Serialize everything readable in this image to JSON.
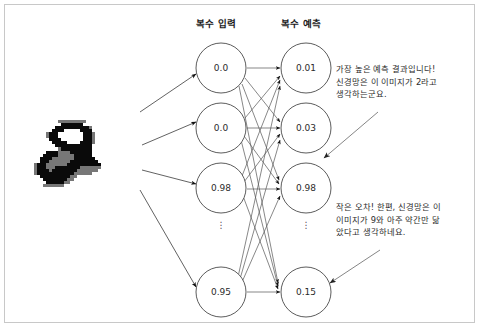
{
  "diagram": {
    "title_inputs": "복수 입력",
    "title_outputs": "복수 예측",
    "ellipsis": "⋮",
    "stroke_color": "#4a4a4a",
    "node_fill": "#ffffff",
    "text_color": "#2b2b2b",
    "border_color": "#c8c8c8"
  },
  "input_layer": {
    "label": "복수 입력",
    "nodes": [
      {
        "id": "input-node-1",
        "value": "0.0"
      },
      {
        "id": "input-node-2",
        "value": "0.0"
      },
      {
        "id": "input-node-3",
        "value": "0.98"
      },
      {
        "id": "input-node-4",
        "value": "0.95"
      }
    ]
  },
  "output_layer": {
    "label": "복수 예측",
    "nodes": [
      {
        "id": "output-node-1",
        "value": "0.01"
      },
      {
        "id": "output-node-2",
        "value": "0.03"
      },
      {
        "id": "output-node-3",
        "value": "0.98"
      },
      {
        "id": "output-node-4",
        "value": "0.15"
      }
    ]
  },
  "source_image": {
    "name": "handwritten-digit-2",
    "description": "픽셀화된 손글씨 숫자 2 이미지"
  },
  "annotations": [
    {
      "id": "annotation-highest-prediction",
      "lines": [
        "가장 높은 예측 결과입니다!",
        "신경망은 이 이미지가 2라고",
        "생각하는군요."
      ],
      "text": "가장 높은 예측 결과입니다! 신경망은 이 이미지가 2라고 생각하는군요."
    },
    {
      "id": "annotation-small-error",
      "lines": [
        "작은 오차! 한편, 신경망은 이",
        "이미지가 9와 아주 약간만 닮",
        "았다고 생각하네요."
      ],
      "text": "작은 오차! 한편, 신경망은 이 이미지가 9와 아주 약간만 닮았다고 생각하네요."
    }
  ]
}
